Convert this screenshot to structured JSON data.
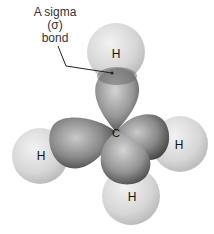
{
  "diagram": {
    "annotation": {
      "line1": "A sigma",
      "line2": "(σ)",
      "line3": "bond"
    },
    "central_atom": "C",
    "atoms": [
      {
        "label": "H",
        "position": "top"
      },
      {
        "label": "H",
        "position": "left"
      },
      {
        "label": "H",
        "position": "right"
      },
      {
        "label": "H",
        "position": "bottom"
      }
    ],
    "colors": {
      "hydrogen": "#d9d9d9",
      "orbital_light": "#c8c8c8",
      "orbital_dark": "#4a4a4a",
      "text": "#222222"
    }
  }
}
